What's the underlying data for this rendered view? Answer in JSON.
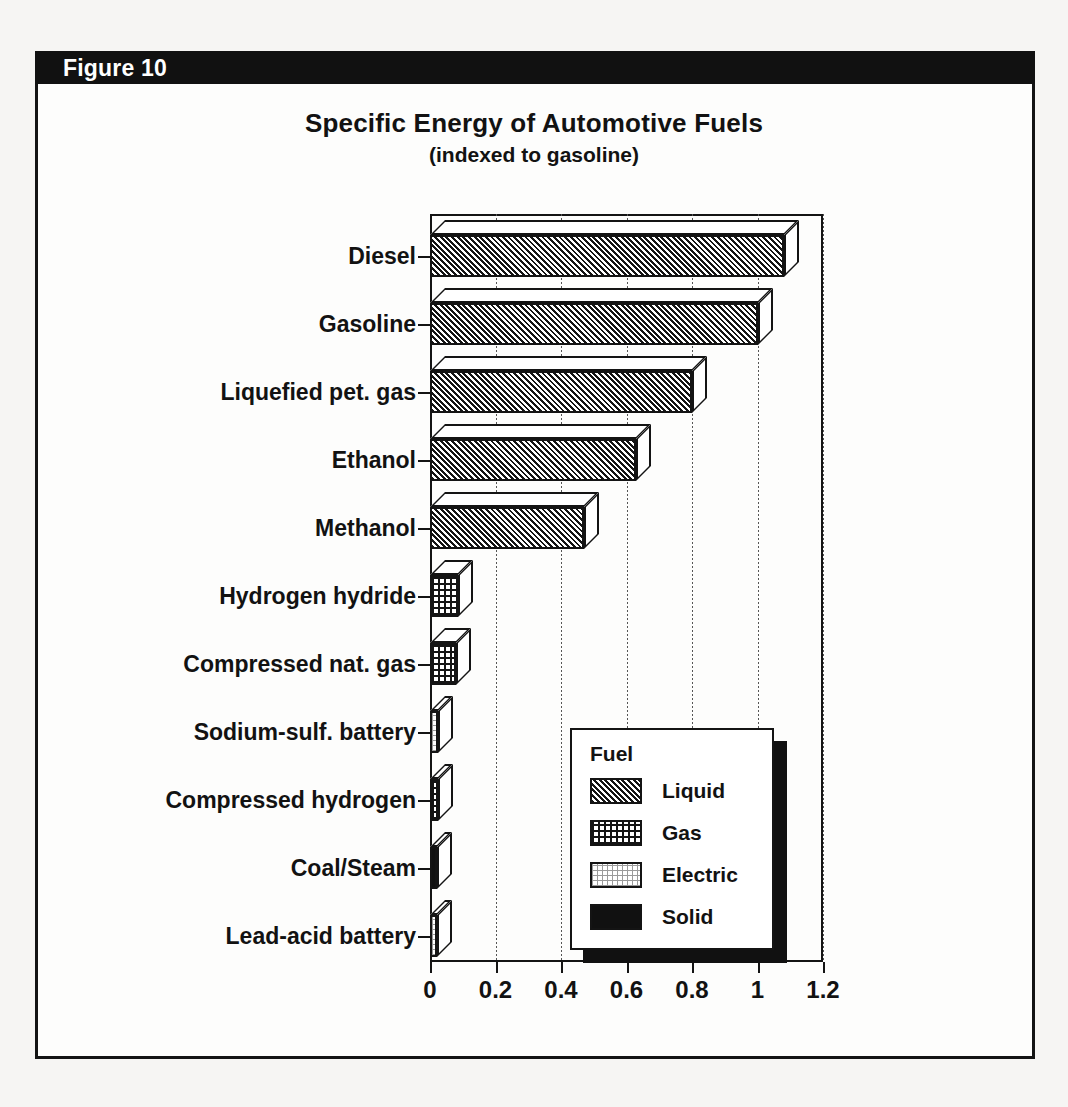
{
  "figure": {
    "header_label": "Figure 10",
    "frame_color": "#141414",
    "header_bg": "#111111",
    "page_bg": "#f6f5f3"
  },
  "chart_data": {
    "type": "bar",
    "orientation": "horizontal",
    "title": "Specific Energy of Automotive Fuels",
    "subtitle": "(indexed to gasoline)",
    "xlabel": "",
    "ylabel": "",
    "xlim": [
      0,
      1.2
    ],
    "xticks": [
      0,
      0.2,
      0.4,
      0.6,
      0.8,
      1,
      1.2
    ],
    "xtick_labels": [
      "0",
      "0.2",
      "0.4",
      "0.6",
      "0.8",
      "1",
      "1.2"
    ],
    "grid": true,
    "grid_axis": "x",
    "grid_style": "dotted",
    "legend_position": "lower-right",
    "legend_title": "Fuel",
    "style": "3d-bar",
    "categories": [
      "Diesel",
      "Gasoline",
      "Liquefied pet. gas",
      "Ethanol",
      "Methanol",
      "Hydrogen hydride",
      "Compressed nat. gas",
      "Sodium-sulf. battery",
      "Compressed hydrogen",
      "Coal/Steam",
      "Lead-acid battery"
    ],
    "values": [
      1.08,
      1.0,
      0.8,
      0.63,
      0.47,
      0.085,
      0.08,
      0.025,
      0.025,
      0.02,
      0.02
    ],
    "group_of_category": [
      "Liquid",
      "Liquid",
      "Liquid",
      "Liquid",
      "Liquid",
      "Gas",
      "Gas",
      "Electric",
      "Gas",
      "Solid",
      "Electric"
    ],
    "series": [
      {
        "name": "Liquid",
        "pattern": "diagonal-hatch",
        "points": [
          {
            "category": "Diesel",
            "value": 1.08
          },
          {
            "category": "Gasoline",
            "value": 1.0
          },
          {
            "category": "Liquefied pet. gas",
            "value": 0.8
          },
          {
            "category": "Ethanol",
            "value": 0.63
          },
          {
            "category": "Methanol",
            "value": 0.47
          }
        ]
      },
      {
        "name": "Gas",
        "pattern": "dot-grid",
        "points": [
          {
            "category": "Hydrogen hydride",
            "value": 0.085
          },
          {
            "category": "Compressed nat. gas",
            "value": 0.08
          },
          {
            "category": "Compressed hydrogen",
            "value": 0.025
          }
        ]
      },
      {
        "name": "Electric",
        "pattern": "light-stipple",
        "points": [
          {
            "category": "Sodium-sulf. battery",
            "value": 0.025
          },
          {
            "category": "Lead-acid battery",
            "value": 0.02
          }
        ]
      },
      {
        "name": "Solid",
        "pattern": "solid-black",
        "points": [
          {
            "category": "Coal/Steam",
            "value": 0.02
          }
        ]
      }
    ]
  },
  "legend": {
    "title": "Fuel",
    "entries": [
      {
        "label": "Liquid",
        "pattern": "diagonal-hatch"
      },
      {
        "label": "Gas",
        "pattern": "dot-grid"
      },
      {
        "label": "Electric",
        "pattern": "light-stipple"
      },
      {
        "label": "Solid",
        "pattern": "solid-black"
      }
    ]
  }
}
